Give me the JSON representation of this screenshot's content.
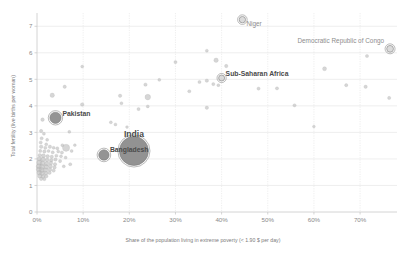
{
  "chart_data": {
    "type": "scatter",
    "title": "",
    "xlabel": "Share of the population living in extreme poverty (< 1.90 $ per day)",
    "ylabel": "Total fertility (live births per woman)",
    "xlim": [
      0,
      78
    ],
    "ylim": [
      0,
      7.5
    ],
    "grid": true,
    "legend": false,
    "xticks": [
      "0%",
      "10%",
      "20%",
      "30%",
      "40%",
      "50%",
      "60%",
      "70%"
    ],
    "xtick_values": [
      0,
      10,
      20,
      30,
      40,
      50,
      60,
      70
    ],
    "yticks": [
      "0",
      "1",
      "2",
      "3",
      "4",
      "5",
      "6",
      "7"
    ],
    "ytick_values": [
      0,
      1,
      2,
      3,
      4,
      5,
      6,
      7
    ],
    "bubble_note": "Bubble area encodes population size",
    "labeled_points": [
      {
        "label": "Niger",
        "x": 44.5,
        "y": 7.25,
        "r": 3.2,
        "label_dx": 4,
        "label_dy": 6,
        "size": "small",
        "ring": true
      },
      {
        "label": "Democratic Republic of Congo",
        "x": 76.5,
        "y": 6.15,
        "r": 3.4,
        "label_dx": -6,
        "label_dy": -6,
        "anchor": "end",
        "size": "small",
        "ring": true
      },
      {
        "label": "Sub-Saharan Africa",
        "x": 40.0,
        "y": 5.05,
        "r": 3.0,
        "label_dx": 4,
        "label_dy": -2,
        "size": "med",
        "ring": true
      },
      {
        "label": "Pakistan",
        "x": 4.0,
        "y": 3.55,
        "r": 5.6,
        "label_dx": 7,
        "label_dy": -2,
        "size": "med",
        "ring": true,
        "fill": "#8e8e8e"
      },
      {
        "label": "India",
        "x": 21.0,
        "y": 2.3,
        "r": 14.5,
        "label_dx": 0,
        "label_dy": -14,
        "anchor": "middle",
        "size": "big",
        "ring": true,
        "fill": "#8c8c8c"
      },
      {
        "label": "Bangladesh",
        "x": 14.5,
        "y": 2.15,
        "r": 5.2,
        "label_dx": 6,
        "label_dy": -3,
        "size": "med",
        "ring": true,
        "fill": "#8e8e8e"
      }
    ],
    "points": [
      {
        "x": 9.8,
        "y": 5.48,
        "r": 1.5
      },
      {
        "x": 30.0,
        "y": 5.65,
        "r": 1.6
      },
      {
        "x": 36.8,
        "y": 6.08,
        "r": 1.5
      },
      {
        "x": 38.8,
        "y": 5.72,
        "r": 2.2
      },
      {
        "x": 41.0,
        "y": 5.5,
        "r": 1.7
      },
      {
        "x": 62.3,
        "y": 5.4,
        "r": 2.0
      },
      {
        "x": 71.5,
        "y": 5.88,
        "r": 1.6
      },
      {
        "x": 3.3,
        "y": 4.4,
        "r": 2.2
      },
      {
        "x": 6.0,
        "y": 4.72,
        "r": 1.7
      },
      {
        "x": 23.5,
        "y": 4.8,
        "r": 1.7
      },
      {
        "x": 26.5,
        "y": 4.98,
        "r": 1.5
      },
      {
        "x": 35.2,
        "y": 4.9,
        "r": 1.6
      },
      {
        "x": 36.8,
        "y": 4.95,
        "r": 1.7
      },
      {
        "x": 38.2,
        "y": 4.82,
        "r": 1.6
      },
      {
        "x": 39.3,
        "y": 4.78,
        "r": 1.5
      },
      {
        "x": 48.0,
        "y": 4.65,
        "r": 1.6
      },
      {
        "x": 52.0,
        "y": 4.66,
        "r": 1.6
      },
      {
        "x": 67.0,
        "y": 4.78,
        "r": 1.6
      },
      {
        "x": 71.2,
        "y": 4.72,
        "r": 1.7
      },
      {
        "x": 76.3,
        "y": 4.3,
        "r": 1.6
      },
      {
        "x": 33.0,
        "y": 4.55,
        "r": 1.6
      },
      {
        "x": 18.0,
        "y": 4.38,
        "r": 1.7
      },
      {
        "x": 24.0,
        "y": 4.33,
        "r": 2.8
      },
      {
        "x": 18.3,
        "y": 4.1,
        "r": 1.5
      },
      {
        "x": 9.8,
        "y": 4.05,
        "r": 1.8
      },
      {
        "x": 22.0,
        "y": 3.88,
        "r": 1.6
      },
      {
        "x": 24.0,
        "y": 3.98,
        "r": 1.5
      },
      {
        "x": 36.8,
        "y": 3.93,
        "r": 1.7
      },
      {
        "x": 55.8,
        "y": 4.02,
        "r": 1.6
      },
      {
        "x": 1.2,
        "y": 3.48,
        "r": 1.8
      },
      {
        "x": 16.0,
        "y": 3.38,
        "r": 1.5
      },
      {
        "x": 17.0,
        "y": 3.3,
        "r": 1.5
      },
      {
        "x": 19.5,
        "y": 3.2,
        "r": 1.4
      },
      {
        "x": 60.0,
        "y": 3.22,
        "r": 1.4
      },
      {
        "x": 0.9,
        "y": 3.05,
        "r": 1.7
      },
      {
        "x": 1.5,
        "y": 2.95,
        "r": 1.5
      },
      {
        "x": 7.0,
        "y": 3.02,
        "r": 1.5
      },
      {
        "x": 1.0,
        "y": 2.78,
        "r": 1.6
      },
      {
        "x": 2.2,
        "y": 2.72,
        "r": 1.5
      },
      {
        "x": 0.8,
        "y": 2.62,
        "r": 1.6
      },
      {
        "x": 2.0,
        "y": 2.55,
        "r": 1.5
      },
      {
        "x": 5.5,
        "y": 2.52,
        "r": 1.5
      },
      {
        "x": 0.9,
        "y": 2.46,
        "r": 1.8
      },
      {
        "x": 1.8,
        "y": 2.42,
        "r": 1.6
      },
      {
        "x": 2.8,
        "y": 2.46,
        "r": 1.7
      },
      {
        "x": 3.6,
        "y": 2.42,
        "r": 1.5
      },
      {
        "x": 4.4,
        "y": 2.4,
        "r": 1.6
      },
      {
        "x": 6.3,
        "y": 2.42,
        "r": 3.6
      },
      {
        "x": 0.7,
        "y": 2.3,
        "r": 1.6
      },
      {
        "x": 1.6,
        "y": 2.28,
        "r": 1.7
      },
      {
        "x": 2.5,
        "y": 2.3,
        "r": 1.5
      },
      {
        "x": 3.4,
        "y": 2.25,
        "r": 1.6
      },
      {
        "x": 4.6,
        "y": 2.28,
        "r": 1.5
      },
      {
        "x": 5.4,
        "y": 2.24,
        "r": 1.6
      },
      {
        "x": 0.6,
        "y": 2.14,
        "r": 1.8
      },
      {
        "x": 1.4,
        "y": 2.12,
        "r": 2.0
      },
      {
        "x": 2.3,
        "y": 2.1,
        "r": 1.8
      },
      {
        "x": 3.2,
        "y": 2.08,
        "r": 1.7
      },
      {
        "x": 4.2,
        "y": 2.12,
        "r": 1.6
      },
      {
        "x": 5.2,
        "y": 2.1,
        "r": 1.5
      },
      {
        "x": 6.2,
        "y": 2.05,
        "r": 1.5
      },
      {
        "x": 0.5,
        "y": 2.0,
        "r": 2.2
      },
      {
        "x": 1.3,
        "y": 1.98,
        "r": 2.4
      },
      {
        "x": 2.2,
        "y": 1.96,
        "r": 2.0
      },
      {
        "x": 3.1,
        "y": 1.95,
        "r": 1.8
      },
      {
        "x": 4.0,
        "y": 1.98,
        "r": 1.7
      },
      {
        "x": 5.0,
        "y": 1.92,
        "r": 1.6
      },
      {
        "x": 0.5,
        "y": 1.86,
        "r": 2.6
      },
      {
        "x": 1.2,
        "y": 1.84,
        "r": 2.5
      },
      {
        "x": 2.1,
        "y": 1.82,
        "r": 2.2
      },
      {
        "x": 3.0,
        "y": 1.85,
        "r": 1.9
      },
      {
        "x": 3.9,
        "y": 1.8,
        "r": 1.7
      },
      {
        "x": 7.2,
        "y": 1.8,
        "r": 1.6
      },
      {
        "x": 0.4,
        "y": 1.72,
        "r": 2.6
      },
      {
        "x": 1.1,
        "y": 1.7,
        "r": 2.6
      },
      {
        "x": 2.0,
        "y": 1.7,
        "r": 2.3
      },
      {
        "x": 2.9,
        "y": 1.72,
        "r": 2.0
      },
      {
        "x": 3.8,
        "y": 1.68,
        "r": 1.7
      },
      {
        "x": 0.4,
        "y": 1.6,
        "r": 2.5
      },
      {
        "x": 1.0,
        "y": 1.58,
        "r": 2.6
      },
      {
        "x": 1.9,
        "y": 1.58,
        "r": 2.2
      },
      {
        "x": 2.8,
        "y": 1.6,
        "r": 1.9
      },
      {
        "x": 3.6,
        "y": 1.56,
        "r": 1.7
      },
      {
        "x": 0.5,
        "y": 1.48,
        "r": 2.4
      },
      {
        "x": 1.1,
        "y": 1.46,
        "r": 2.4
      },
      {
        "x": 1.9,
        "y": 1.46,
        "r": 2.0
      },
      {
        "x": 2.7,
        "y": 1.48,
        "r": 1.8
      },
      {
        "x": 0.6,
        "y": 1.36,
        "r": 2.2
      },
      {
        "x": 1.3,
        "y": 1.34,
        "r": 2.0
      },
      {
        "x": 2.0,
        "y": 1.35,
        "r": 1.8
      },
      {
        "x": 0.9,
        "y": 1.25,
        "r": 1.8
      },
      {
        "x": 1.6,
        "y": 1.24,
        "r": 1.6
      },
      {
        "x": 5.8,
        "y": 1.72,
        "r": 1.5
      },
      {
        "x": 7.5,
        "y": 2.3,
        "r": 1.5
      },
      {
        "x": 8.2,
        "y": 2.52,
        "r": 1.4
      }
    ]
  },
  "colors": {
    "point_fill": "#bdbdbd",
    "point_fill_dark": "#8c8c8c",
    "grid": "#e3e3e3",
    "axis": "#c9c9c9",
    "tick_text": "#8a8a8a",
    "label_text": "#4a4a4a",
    "background": "#ffffff"
  }
}
